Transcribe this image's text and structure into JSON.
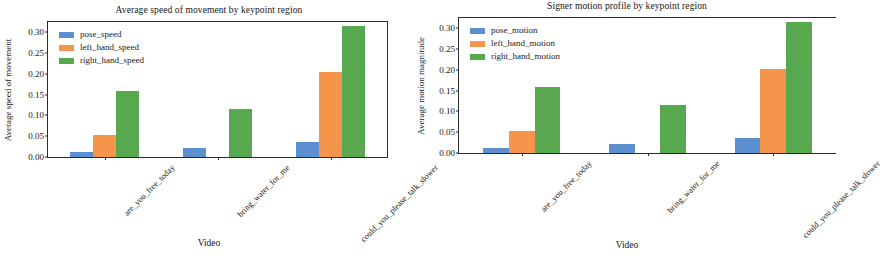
{
  "figure": {
    "panels": [
      {
        "key": "speed",
        "title": "Average speed of movement by keypoint region",
        "xlabel": "Video",
        "ylabel": "Average speed of movement"
      },
      {
        "key": "motion",
        "title": "Signer motion profile by keypoint region",
        "xlabel": "Video",
        "ylabel": "Average motion magnitude"
      }
    ]
  },
  "colors": {
    "pose": "#5b8fd0",
    "left_hand": "#f4954b",
    "right_hand": "#57a84f",
    "axis": "#2b2b2b",
    "text": "#141414",
    "background": "#ffffff"
  },
  "axis": {
    "yticks": [
      "0.00",
      "0.05",
      "0.10",
      "0.15",
      "0.20",
      "0.25",
      "0.30"
    ],
    "ytick_values": [
      0.0,
      0.05,
      0.1,
      0.15,
      0.2,
      0.25,
      0.3
    ],
    "ylim": [
      0.0,
      0.325
    ],
    "categories": [
      "are_you_free_today",
      "bring_water_for_me",
      "could_you_please_talk_slower"
    ]
  },
  "chart_data": [
    {
      "type": "bar",
      "title": "Average speed of movement by keypoint region",
      "xlabel": "Video",
      "ylabel": "Average speed of movement",
      "categories": [
        "are_you_free_today",
        "bring_water_for_me",
        "could_you_please_talk_slower"
      ],
      "series": [
        {
          "name": "pose_speed",
          "color": "#5b8fd0",
          "values": [
            0.012,
            0.021,
            0.036
          ]
        },
        {
          "name": "left_hand_speed",
          "color": "#f4954b",
          "values": [
            0.053,
            0.0,
            0.204
          ]
        },
        {
          "name": "right_hand_speed",
          "color": "#57a84f",
          "values": [
            0.158,
            0.116,
            0.315
          ]
        }
      ],
      "ylim": [
        0.0,
        0.325
      ],
      "yticks": [
        0.0,
        0.05,
        0.1,
        0.15,
        0.2,
        0.25,
        0.3
      ],
      "grid": false,
      "legend_position": "upper left"
    },
    {
      "type": "bar",
      "title": "Signer motion profile by keypoint region",
      "xlabel": "Video",
      "ylabel": "Average motion magnitude",
      "categories": [
        "are_you_free_today",
        "bring_water_for_me",
        "could_you_please_talk_slower"
      ],
      "series": [
        {
          "name": "pose_motion",
          "color": "#5b8fd0",
          "values": [
            0.012,
            0.021,
            0.036
          ]
        },
        {
          "name": "left_hand_motion",
          "color": "#f4954b",
          "values": [
            0.053,
            0.0,
            0.202
          ]
        },
        {
          "name": "right_hand_motion",
          "color": "#57a84f",
          "values": [
            0.158,
            0.115,
            0.315
          ]
        }
      ],
      "ylim": [
        0.0,
        0.325
      ],
      "yticks": [
        0.0,
        0.05,
        0.1,
        0.15,
        0.2,
        0.25,
        0.3
      ],
      "grid": false,
      "legend_position": "upper left"
    }
  ]
}
